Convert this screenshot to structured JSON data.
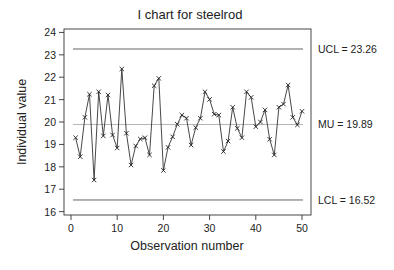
{
  "chart_data": {
    "type": "line",
    "title": "I chart for steelrod",
    "xlabel": "Observation number",
    "ylabel": "Individual value",
    "xlim": [
      0,
      50
    ],
    "ylim": [
      16,
      24
    ],
    "x_ticks": [
      0,
      10,
      20,
      30,
      40,
      50
    ],
    "y_ticks": [
      16,
      17,
      18,
      19,
      20,
      21,
      22,
      23,
      24
    ],
    "grid": false,
    "marker": "x",
    "series": [
      {
        "name": "Individual value",
        "x": [
          1,
          2,
          3,
          4,
          5,
          6,
          7,
          8,
          9,
          10,
          11,
          12,
          13,
          14,
          15,
          16,
          17,
          18,
          19,
          20,
          21,
          22,
          23,
          24,
          25,
          26,
          27,
          28,
          29,
          30,
          31,
          32,
          33,
          34,
          35,
          36,
          37,
          38,
          39,
          40,
          41,
          42,
          43,
          44,
          45,
          46,
          47,
          48,
          49,
          50
        ],
        "values": [
          19.3,
          18.45,
          20.21,
          21.24,
          17.41,
          21.35,
          19.38,
          21.21,
          19.42,
          18.84,
          22.37,
          19.5,
          18.08,
          18.93,
          19.24,
          19.3,
          18.53,
          21.62,
          21.95,
          17.84,
          18.87,
          19.34,
          19.9,
          20.31,
          20.17,
          18.97,
          19.75,
          20.17,
          21.35,
          21.01,
          20.35,
          20.31,
          18.68,
          19.15,
          20.66,
          19.72,
          19.3,
          21.35,
          21.1,
          19.79,
          20.0,
          20.54,
          19.23,
          18.53,
          20.66,
          20.8,
          21.65,
          20.21,
          19.87,
          20.48
        ]
      }
    ],
    "reference_lines": [
      {
        "name": "UCL",
        "value": 23.26,
        "label": "UCL = 23.26"
      },
      {
        "name": "MU",
        "value": 19.89,
        "label": "MU = 19.89"
      },
      {
        "name": "LCL",
        "value": 16.52,
        "label": "LCL = 16.52"
      }
    ]
  }
}
